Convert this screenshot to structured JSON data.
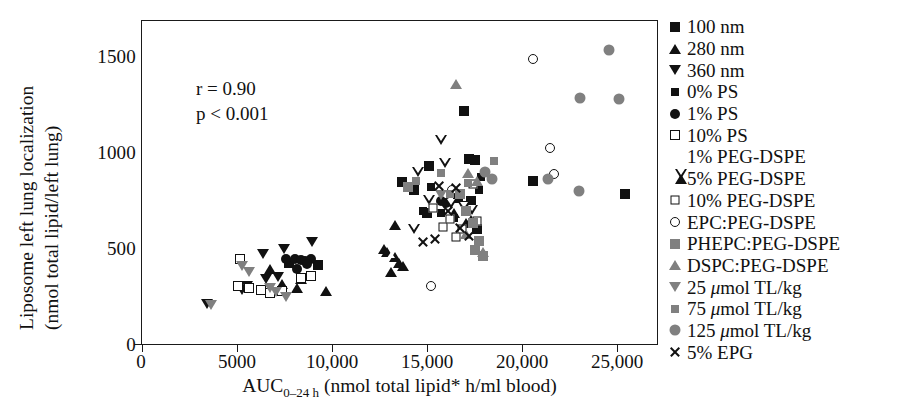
{
  "axes": {
    "y_label_line1": "Liposome left lung localization",
    "y_label_line2": "(nmol total lipid/left lung)",
    "x_label_prefix": "AUC",
    "x_label_sub": "0–24 h",
    "x_label_suffix": " (nmol total lipid* h/ml blood)",
    "y_ticks": [
      "0",
      "500",
      "1000",
      "1500"
    ],
    "x_ticks": [
      "0",
      "5000",
      "10,000",
      "15,000",
      "20,000",
      "25,000"
    ]
  },
  "annotations": {
    "correlation": "r = 0.90",
    "pvalue": "p < 0.001"
  },
  "legend": {
    "items": [
      {
        "label": "100 nm",
        "marker": "square",
        "color": "#111111"
      },
      {
        "label": "280 nm",
        "marker": "triangle-up",
        "color": "#111111"
      },
      {
        "label": "360 nm",
        "marker": "triangle-down",
        "color": "#111111"
      },
      {
        "label": "0% PS",
        "marker": "diamond",
        "color": "#111111"
      },
      {
        "label": "1% PS",
        "marker": "circle",
        "color": "#111111"
      },
      {
        "label": "10% PS",
        "marker": "square-open",
        "color": "#111111"
      },
      {
        "label": "1% PEG-DSPE",
        "marker": "triangle-up-open",
        "color": "#111111"
      },
      {
        "label": "5% PEG-DSPE",
        "marker": "triangle-down-open",
        "color": "#111111"
      },
      {
        "label": "10% PEG-DSPE",
        "marker": "diamond-open",
        "color": "#111111"
      },
      {
        "label": "EPC:PEG-DSPE",
        "marker": "circle-open",
        "color": "#111111"
      },
      {
        "label": "PHEPC:PEG-DSPE",
        "marker": "square-gray",
        "color": "#808080"
      },
      {
        "label": "DSPC:PEG-DSPE",
        "marker": "triangle-up-gray",
        "color": "#808080"
      },
      {
        "label": "25 μmol TL/kg",
        "marker": "triangle-down-gray",
        "color": "#808080",
        "italic_prefix": "25 ",
        "italic_mu": "μ",
        "rest": "mol TL/kg"
      },
      {
        "label": "75 μmol TL/kg",
        "marker": "diamond-gray",
        "color": "#808080",
        "italic_prefix": "75 ",
        "italic_mu": "μ",
        "rest": "mol TL/kg"
      },
      {
        "label": "125 μmol TL/kg",
        "marker": "circle-gray",
        "color": "#808080",
        "italic_prefix": "125 ",
        "italic_mu": "μ",
        "rest": "mol TL/kg"
      },
      {
        "label": "5% EPG",
        "marker": "cross",
        "color": "#111111"
      }
    ]
  },
  "chart_data": {
    "type": "scatter",
    "title": "",
    "xlabel": "AUC(0-24 h) (nmol total lipid* h/ml blood)",
    "ylabel": "Liposome left lung localization (nmol total lipid/left lung)",
    "xlim": [
      0,
      27000
    ],
    "ylim": [
      0,
      1690
    ],
    "grid": false,
    "legend_position": "right-outside",
    "annotations": [
      "r = 0.90",
      "p < 0.001"
    ],
    "series": [
      {
        "name": "100 nm",
        "marker": "square",
        "color": "#111111",
        "points": [
          [
            16800,
            1220
          ],
          [
            17100,
            975
          ],
          [
            17400,
            965
          ],
          [
            15000,
            935
          ],
          [
            13600,
            855
          ],
          [
            14200,
            810
          ],
          [
            16500,
            770
          ],
          [
            17200,
            755
          ],
          [
            20400,
            860
          ],
          [
            17500,
            610
          ],
          [
            25200,
            790
          ],
          [
            14900,
            690
          ],
          [
            7700,
            430
          ],
          [
            9200,
            420
          ]
        ]
      },
      {
        "name": "280 nm",
        "marker": "triangle-up",
        "color": "#111111",
        "points": [
          [
            6700,
            400
          ],
          [
            7300,
            325
          ],
          [
            8100,
            300
          ],
          [
            8300,
            350
          ],
          [
            9600,
            285
          ],
          [
            16900,
            640
          ],
          [
            17200,
            655
          ],
          [
            16300,
            690
          ],
          [
            13200,
            630
          ]
        ]
      },
      {
        "name": "360 nm",
        "marker": "triangle-down",
        "color": "#111111",
        "points": [
          [
            3400,
            220
          ],
          [
            5200,
            290
          ],
          [
            5500,
            310
          ],
          [
            6300,
            480
          ],
          [
            7400,
            505
          ],
          [
            8900,
            540
          ],
          [
            6500,
            350
          ],
          [
            7100,
            360
          ]
        ]
      },
      {
        "name": "0% PS",
        "marker": "diamond",
        "color": "#111111",
        "points": [
          [
            15100,
            825
          ],
          [
            17700,
            880
          ],
          [
            17600,
            810
          ],
          [
            15600,
            690
          ],
          [
            14700,
            700
          ],
          [
            16900,
            735
          ],
          [
            16300,
            665
          ]
        ]
      },
      {
        "name": "1% PS",
        "marker": "circle",
        "color": "#111111",
        "points": [
          [
            7500,
            455
          ],
          [
            8000,
            455
          ],
          [
            8300,
            445
          ],
          [
            8500,
            440
          ],
          [
            8800,
            450
          ],
          [
            8600,
            425
          ],
          [
            8100,
            400
          ],
          [
            15600,
            755
          ],
          [
            15900,
            745
          ]
        ]
      },
      {
        "name": "10% PS",
        "marker": "square-open",
        "color": "#111111",
        "points": [
          [
            5100,
            455
          ],
          [
            5000,
            310
          ],
          [
            5600,
            300
          ],
          [
            6200,
            290
          ],
          [
            6700,
            275
          ],
          [
            7300,
            285
          ],
          [
            8300,
            355
          ],
          [
            8800,
            365
          ]
        ]
      },
      {
        "name": "1% PEG-DSPE",
        "marker": "triangle-up-open",
        "color": "#111111",
        "points": [
          [
            12300,
            620
          ],
          [
            12500,
            605
          ],
          [
            12900,
            575
          ],
          [
            13100,
            545
          ],
          [
            12700,
            500
          ],
          [
            13300,
            530
          ]
        ]
      },
      {
        "name": "5% PEG-DSPE",
        "marker": "triangle-down-open",
        "color": "#111111",
        "points": [
          [
            15300,
            1045
          ],
          [
            14100,
            880
          ],
          [
            15500,
            925
          ],
          [
            14700,
            735
          ],
          [
            15800,
            710
          ],
          [
            16500,
            695
          ],
          [
            16900,
            680
          ],
          [
            13900,
            580
          ]
        ]
      },
      {
        "name": "10% PEG-DSPE",
        "marker": "diamond-open",
        "color": "#111111",
        "points": [
          [
            17300,
            840
          ],
          [
            16100,
            660
          ],
          [
            17500,
            650
          ],
          [
            15700,
            620
          ],
          [
            16700,
            610
          ],
          [
            16400,
            565
          ],
          [
            15200,
            720
          ]
        ]
      },
      {
        "name": "EPC:PEG-DSPE",
        "marker": "circle-open",
        "color": "#111111",
        "points": [
          [
            20400,
            1490
          ],
          [
            21300,
            1030
          ],
          [
            21500,
            895
          ],
          [
            16200,
            810
          ],
          [
            15100,
            310
          ]
        ]
      },
      {
        "name": "PHEPC:PEG-DSPE",
        "marker": "square-gray",
        "color": "#808080",
        "points": [
          [
            16600,
            790
          ],
          [
            16900,
            700
          ],
          [
            17300,
            640
          ],
          [
            17600,
            545
          ],
          [
            17400,
            500
          ],
          [
            13900,
            825
          ],
          [
            17800,
            470
          ]
        ]
      },
      {
        "name": "DSPC:PEG-DSPE",
        "marker": "triangle-up-gray",
        "color": "#808080",
        "points": [
          [
            16400,
            1365
          ],
          [
            17000,
            900
          ],
          [
            17500,
            860
          ],
          [
            17800,
            490
          ],
          [
            16900,
            580
          ]
        ]
      },
      {
        "name": "25 μmol TL/kg",
        "marker": "triangle-down-gray",
        "color": "#808080",
        "points": [
          [
            3600,
            215
          ],
          [
            5200,
            415
          ],
          [
            5600,
            385
          ],
          [
            6700,
            300
          ],
          [
            7000,
            280
          ],
          [
            7500,
            255
          ],
          [
            15600,
            785
          ]
        ]
      },
      {
        "name": "75 μmol TL/kg",
        "marker": "diamond-gray",
        "color": "#808080",
        "points": [
          [
            14300,
            860
          ],
          [
            15600,
            900
          ],
          [
            18400,
            960
          ],
          [
            17000,
            850
          ],
          [
            16100,
            790
          ]
        ]
      },
      {
        "name": "125 μmol TL/kg",
        "marker": "circle-gray",
        "color": "#808080",
        "points": [
          [
            24400,
            1540
          ],
          [
            22900,
            1290
          ],
          [
            24900,
            1285
          ],
          [
            22800,
            805
          ],
          [
            21200,
            870
          ],
          [
            17900,
            905
          ],
          [
            18300,
            870
          ]
        ]
      },
      {
        "name": "5% EPG",
        "marker": "cross",
        "color": "#111111",
        "points": [
          [
            15500,
            830
          ],
          [
            16400,
            820
          ],
          [
            16000,
            700
          ],
          [
            15300,
            555
          ],
          [
            16600,
            615
          ],
          [
            17100,
            570
          ],
          [
            14700,
            540
          ]
        ]
      }
    ]
  }
}
